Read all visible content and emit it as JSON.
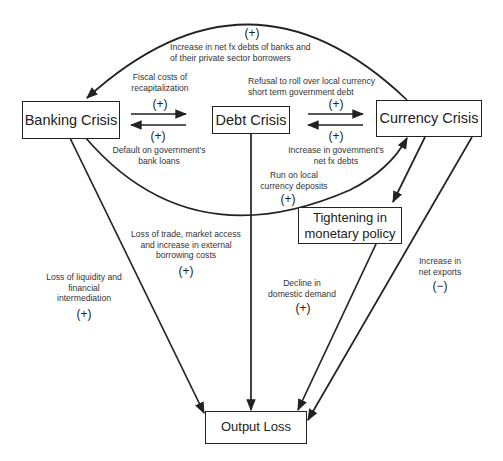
{
  "nodes": {
    "banking_crisis": "Banking Crisis",
    "debt_crisis": "Debt Crisis",
    "currency_crisis": "Currency Crisis",
    "tightening": "Tightening in\nmonetary policy",
    "output_loss": "Output Loss"
  },
  "edges": {
    "currency_to_banking_arc": {
      "label": "Increase in net fx debts of banks and\nof their private sector borrowers",
      "sign": "(+)"
    },
    "banking_to_debt": {
      "label": "Fiscal costs of\nrecapitalization",
      "sign": "(+)"
    },
    "debt_to_banking": {
      "label": "Default on government's\nbank loans",
      "sign": "(+)"
    },
    "debt_to_currency": {
      "label": "Refusal to roll over local currency\nshort term government debt",
      "sign": "(+)"
    },
    "currency_to_debt": {
      "label": "Increase in government's\nnet fx debts",
      "sign": "(+)"
    },
    "banking_to_currency_arc": {
      "label": "Run on local\ncurrency deposits",
      "sign": "(+)"
    },
    "banking_to_output": {
      "label": "Loss of liquidity and\nfinancial\nintermediation",
      "sign": "(+)"
    },
    "debt_to_output": {
      "label": "Loss of trade, market access\nand increase in external\nborrowing costs",
      "sign": "(+)"
    },
    "tightening_to_output": {
      "label": "Decline in\ndomestic demand",
      "sign": "(+)"
    },
    "currency_to_output": {
      "label": "Increase in\nnet exports",
      "sign": "(−)"
    },
    "currency_to_tightening": {
      "label": "",
      "sign": ""
    }
  },
  "colors": {
    "line": "#222222",
    "text": "#333333",
    "background": "#ffffff"
  }
}
